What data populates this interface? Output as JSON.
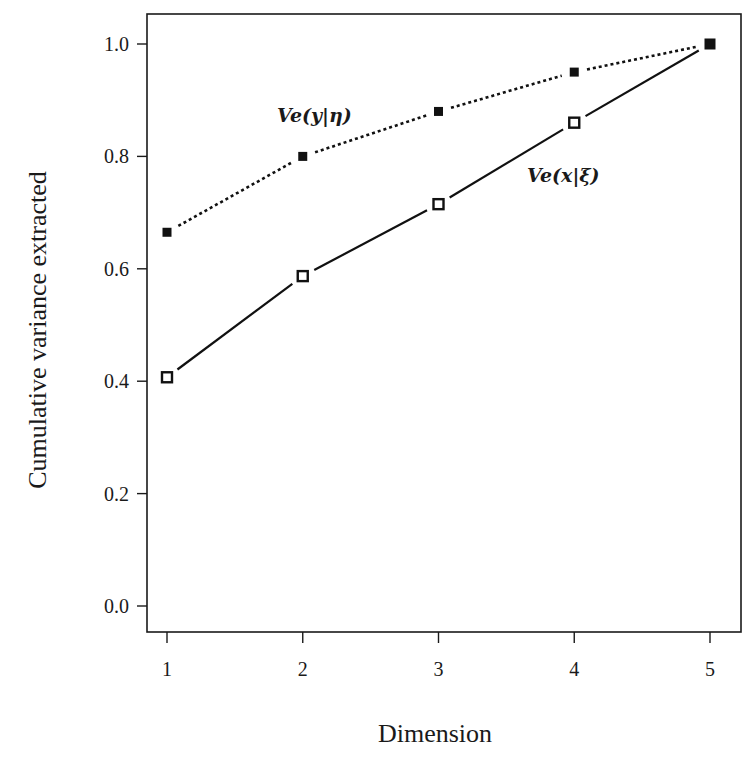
{
  "chart_data": {
    "type": "line",
    "title": "",
    "xlabel": "Dimension",
    "ylabel": "Cumulative variance extracted",
    "x": [
      1,
      2,
      3,
      4,
      5
    ],
    "x_ticks": [
      "1",
      "2",
      "3",
      "4",
      "5"
    ],
    "y_ticks": [
      "0.0",
      "0.2",
      "0.4",
      "0.6",
      "0.8",
      "1.0"
    ],
    "ylim": [
      0.0,
      1.0
    ],
    "xlim": [
      1,
      5
    ],
    "grid": false,
    "legend": "inline labels",
    "series": [
      {
        "name": "Ve(y|η)",
        "values": [
          0.665,
          0.8,
          0.88,
          0.95,
          1.0
        ],
        "line_style": "dotted",
        "marker": "filled-square",
        "color": "#111111"
      },
      {
        "name": "Ve(x|ξ)",
        "values": [
          0.407,
          0.587,
          0.715,
          0.86,
          1.0
        ],
        "line_style": "solid",
        "marker": "open-square",
        "color": "#111111"
      }
    ],
    "annotations": [
      {
        "text": "Ve(y|η)",
        "series": 0,
        "near_x": 2.1
      },
      {
        "text": "Ve(x|ξ)",
        "series": 1,
        "near_x": 4.0
      }
    ]
  }
}
